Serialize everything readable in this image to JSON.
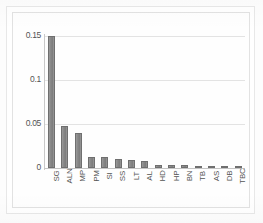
{
  "chart_data": {
    "type": "bar",
    "title": "",
    "subtitle": "",
    "xlabel": "",
    "ylabel": "",
    "categories": [
      "SG",
      "ALN",
      "MP",
      "PM",
      "SI",
      "SS",
      "LT",
      "AL",
      "HD",
      "HP",
      "BN",
      "TB",
      "AS",
      "DB",
      "TBC"
    ],
    "values": [
      0.15,
      0.048,
      0.04,
      0.013,
      0.012,
      0.01,
      0.009,
      0.008,
      0.003,
      0.003,
      0.003,
      0.002,
      0.002,
      0.002,
      0.002
    ],
    "series": [
      {
        "name": "",
        "values": [
          0.15,
          0.048,
          0.04,
          0.013,
          0.012,
          0.01,
          0.009,
          0.008,
          0.003,
          0.003,
          0.003,
          0.002,
          0.002,
          0.002,
          0.002
        ]
      }
    ],
    "ylim": [
      0,
      0.15
    ],
    "yticks": [
      "0",
      "0.05",
      "0.1",
      "0.15"
    ],
    "ytick_values": [
      0,
      0.05,
      0.1,
      0.15
    ],
    "grid": true,
    "grid_axis": "y",
    "legend": false,
    "legend_position": "none",
    "bar_color": "#8a8a8a",
    "bar_edge_color": "#6f6f6f",
    "gridline_color": "#e3e3e3",
    "axis_color": "#c4c4c4",
    "tick_label_color": "#545454",
    "xtick_rotation": 90,
    "annotations": []
  }
}
